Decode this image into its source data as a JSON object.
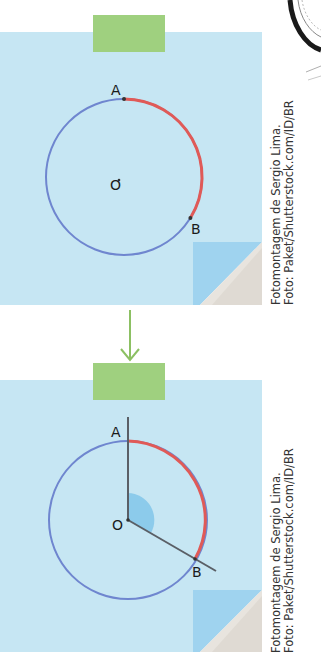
{
  "colors": {
    "note": "#c6e6f3",
    "note_fold": "#9fd3ef",
    "tape": "#9fd07f",
    "circle": "#6f86cf",
    "arc_highlight": "#e05a57",
    "ray": "#5a5f66",
    "angle_fill": "#8ccbeb",
    "arrow": "#8cc063",
    "text": "#1a1a1a"
  },
  "panels": [
    {
      "id": "before",
      "labels": {
        "A": "A",
        "B": "B",
        "O": "O"
      },
      "circle": {
        "cx": 124,
        "cy": 177,
        "r": 78
      },
      "point_A": {
        "x": 124,
        "y": 99
      },
      "point_B": {
        "x": 190,
        "y": 218
      },
      "show_rays": false,
      "credit": [
        "Fotomontagem de Sergio Lima.",
        "Foto: Paket/Shutterstock.com/ID/BR"
      ]
    },
    {
      "id": "after",
      "labels": {
        "A": "A",
        "B": "B",
        "O": "O"
      },
      "circle": {
        "cx": 128,
        "cy": 520,
        "r": 79
      },
      "point_A": {
        "x": 128,
        "y": 441
      },
      "point_B": {
        "x": 195,
        "y": 559
      },
      "show_rays": true,
      "credit": [
        "Fotomontagem de Sergio Lima.",
        "Foto: Paket/Shutterstock.com/ID/BR"
      ]
    }
  ],
  "arrow": {
    "direction": "down"
  }
}
